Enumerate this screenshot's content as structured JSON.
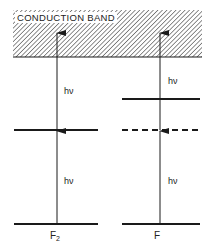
{
  "diagram": {
    "band": {
      "label": "CONDUCTION BAND",
      "fill": "hatched"
    },
    "columns": [
      {
        "id": "F2",
        "label_main": "F",
        "label_sub": "2",
        "levels": [
          {
            "type": "solid",
            "position": "ground"
          },
          {
            "type": "solid",
            "position": "middle"
          }
        ],
        "transitions": [
          {
            "from": "ground",
            "to": "middle",
            "label": "hν"
          },
          {
            "from": "middle",
            "to": "conduction band",
            "label": "hν"
          }
        ]
      },
      {
        "id": "F",
        "label_main": "F",
        "label_sub": "",
        "levels": [
          {
            "type": "solid",
            "position": "ground"
          },
          {
            "type": "dashed",
            "position": "middle (virtual)"
          },
          {
            "type": "solid",
            "position": "upper"
          }
        ],
        "transitions": [
          {
            "from": "ground",
            "to": "virtual",
            "label": "hν"
          },
          {
            "from": "virtual",
            "to": "conduction band",
            "label": "hν"
          }
        ]
      }
    ],
    "colors": {
      "line": "#1a1a1a",
      "background": "#ffffff"
    }
  }
}
